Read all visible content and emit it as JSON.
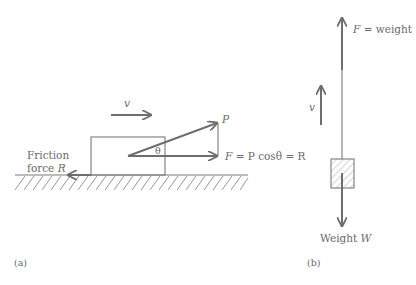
{
  "figure_a": {
    "velocity_label": "v",
    "force_p_label": "P",
    "angle_label": "θ",
    "equation_label_F": "F",
    "equation_label_rest": " = P cosθ = R",
    "friction_line1": "Friction",
    "friction_line2_prefix": "force ",
    "friction_line2_var": "R",
    "panel_label": "(a)"
  },
  "figure_b": {
    "force_label_var": "F",
    "force_label_rest": " = weight",
    "velocity_label": "v",
    "weight_label_prefix": "Weight ",
    "weight_label_var": "W",
    "panel_label": "(b)"
  },
  "colors": {
    "line": "#7a7a7a",
    "text": "#6a6a6a",
    "background": "#ffffff"
  }
}
